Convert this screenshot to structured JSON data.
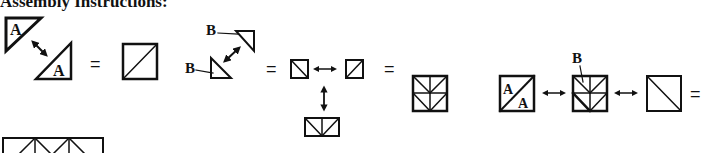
{
  "heading": "Assembly Instructions:",
  "labels": {
    "a": "A",
    "b": "B"
  },
  "symbols": {
    "equals": "="
  },
  "steps": [
    {
      "name": "step-1",
      "description": "Two A triangles join to form a half-square triangle block"
    },
    {
      "name": "step-2",
      "description": "Two small B triangles join; two units join into a rectangle"
    },
    {
      "name": "step-3",
      "description": "Two rectangles join to form a chevron square"
    },
    {
      "name": "step-4",
      "description": "A/A square, B chevron square and plain diagonal square joined in a row"
    }
  ]
}
